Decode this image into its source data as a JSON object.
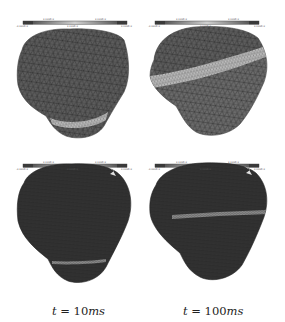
{
  "figure": {
    "panels": [
      {
        "id": "top-left",
        "time": "t = 10ms",
        "mesh_resolution": "coarse",
        "band_position": "bottom",
        "colorbar": {
          "min_label": "-x.xxxE-x",
          "low_label": "x.xxxE-x",
          "mid_label": "x.xxxE-x",
          "high_label": "x.xxxE-x",
          "max_label": "x.xxxE-x"
        }
      },
      {
        "id": "top-right",
        "time": "t = 100ms",
        "mesh_resolution": "coarse",
        "band_position": "upper",
        "colorbar": {
          "min_label": "-x.xxxE-x",
          "low_label": "x.xxxE-x",
          "mid_label": "x.xxxE-x",
          "high_label": "x.xxxE-x",
          "max_label": "x.xxxE-x"
        }
      },
      {
        "id": "bottom-left",
        "time": "t = 10ms",
        "mesh_resolution": "fine",
        "band_position": "bottom",
        "colorbar": {
          "min_label": "-x.xxxE-x",
          "low_label": "x.xxxE-x",
          "mid_label": "x.xxxE-x",
          "high_label": "x.xxxE-x",
          "max_label": "x.xxxE-x"
        }
      },
      {
        "id": "bottom-right",
        "time": "t = 100ms",
        "mesh_resolution": "fine",
        "band_position": "middle",
        "colorbar": {
          "min_label": "-x.xxxE-x",
          "low_label": "x.xxxE-x",
          "mid_label": "x.xxxE-x",
          "high_label": "x.xxxE-x",
          "max_label": "x.xxxE-x"
        }
      }
    ],
    "captions": {
      "left": {
        "var": "t",
        "eq": " = ",
        "value": "10",
        "unit": "ms"
      },
      "right": {
        "var": "t",
        "eq": " = ",
        "value": "100",
        "unit": "ms"
      }
    },
    "colors": {
      "mesh_coarse": "#5a5a5a",
      "mesh_fine": "#333333",
      "edge_coarse": "#2a2a2a",
      "band": "#b8b8b8",
      "band_fine": "#8a8a8a",
      "colorbar_dark": "#555555",
      "colorbar_light": "#cfcfcf"
    }
  }
}
